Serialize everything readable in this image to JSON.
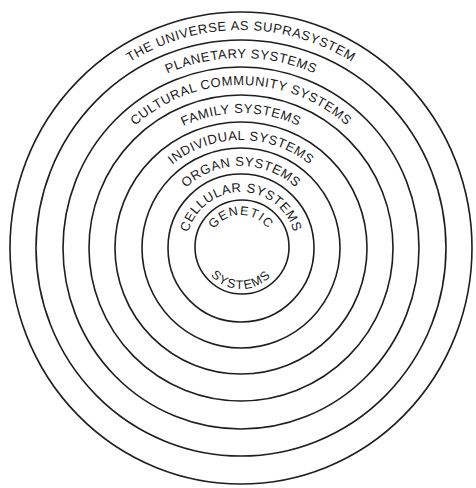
{
  "diagram": {
    "center": {
      "x": 241,
      "y": 248
    },
    "stroke_color": "#1e1e1e",
    "background": "#ffffff",
    "levels": [
      {
        "label": "THE UNIVERSE AS SUPRASYSTEM",
        "outer_rx": 231,
        "outer_ry": 236
      },
      {
        "label": "PLANETARY SYSTEMS",
        "outer_rx": 205,
        "outer_ry": 208
      },
      {
        "label": "CULTURAL COMMUNITY SYSTEMS",
        "outer_rx": 178,
        "outer_ry": 181
      },
      {
        "label": "FAMILY SYSTEMS",
        "outer_rx": 152,
        "outer_ry": 153
      },
      {
        "label": "INDIVIDUAL SYSTEMS",
        "outer_rx": 126,
        "outer_ry": 126
      },
      {
        "label": "ORGAN SYSTEMS",
        "outer_rx": 99,
        "outer_ry": 100
      },
      {
        "label": "CELLULAR SYSTEMS",
        "outer_rx": 73,
        "outer_ry": 74
      },
      {
        "label_top": "GENETIC",
        "label_bottom": "SYSTEMS",
        "outer_rx": 47,
        "outer_ry": 47
      }
    ]
  }
}
